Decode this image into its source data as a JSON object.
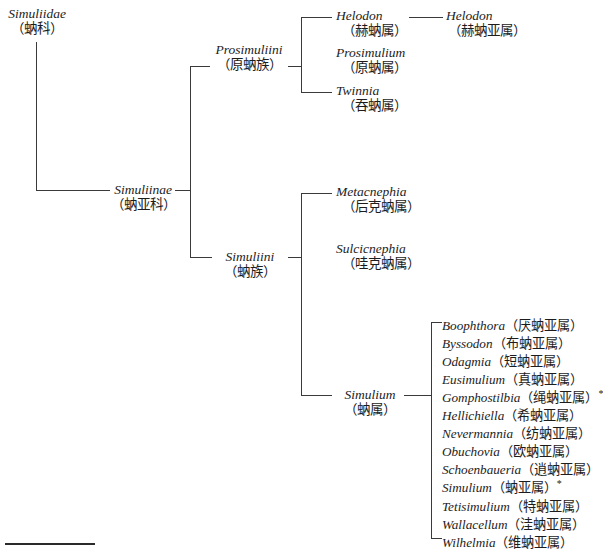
{
  "figure": {
    "type": "cladogram",
    "footnote_rule": true
  },
  "taxa": {
    "family": {
      "latin": "Simuliidae",
      "chinese": "（蚋科）"
    },
    "subfamily": {
      "latin": "Simuliinae",
      "chinese": "（蚋亚科）"
    },
    "tribe_prosimuliini": {
      "latin": "Prosimuliini",
      "chinese": "（原蚋族）"
    },
    "tribe_simuliini": {
      "latin": "Simuliini",
      "chinese": "（蚋族）"
    },
    "genus_helodon": {
      "latin": "Helodon",
      "chinese": "（赫蚋属）"
    },
    "subgenus_helodon": {
      "latin": "Helodon",
      "chinese": "（赫蚋亚属）"
    },
    "genus_prosimulium": {
      "latin": "Prosimulium",
      "chinese": "（原蚋属）"
    },
    "genus_twinnia": {
      "latin": "Twinnia",
      "chinese": "（吞蚋属）"
    },
    "genus_metacnephia": {
      "latin": "Metacnephia",
      "chinese": "（后克蚋属）"
    },
    "genus_sulcicnephia": {
      "latin": "Sulcicnephia",
      "chinese": "（哇克蚋属）"
    },
    "genus_simulium": {
      "latin": "Simulium",
      "chinese": "（蚋属）"
    }
  },
  "subgenera": [
    {
      "latin": "Boophthora",
      "chinese": "（厌蚋亚属）",
      "mark": ""
    },
    {
      "latin": "Byssodon",
      "chinese": "（布蚋亚属）",
      "mark": ""
    },
    {
      "latin": "Odagmia",
      "chinese": "（短蚋亚属）",
      "mark": ""
    },
    {
      "latin": "Eusimulium",
      "chinese": "（真蚋亚属）",
      "mark": ""
    },
    {
      "latin": "Gomphostilbia",
      "chinese": "（绳蚋亚属）",
      "mark": "*"
    },
    {
      "latin": "Hellichiella",
      "chinese": "（希蚋亚属）",
      "mark": ""
    },
    {
      "latin": "Nevermannia",
      "chinese": "（纺蚋亚属）",
      "mark": ""
    },
    {
      "latin": "Obuchovia",
      "chinese": "（欧蚋亚属）",
      "mark": ""
    },
    {
      "latin": "Schoenbaueria",
      "chinese": "（逍蚋亚属）",
      "mark": ""
    },
    {
      "latin": "Simulium",
      "chinese": "（蚋亚属）",
      "mark": "*"
    },
    {
      "latin": "Tetisimulium",
      "chinese": "（特蚋亚属）",
      "mark": ""
    },
    {
      "latin": "Wallacellum",
      "chinese": "（洼蚋亚属）",
      "mark": ""
    },
    {
      "latin": "Wilhelmia",
      "chinese": "（维蚋亚属）",
      "mark": ""
    }
  ],
  "colors": {
    "text": "#1c1c1c",
    "line": "#3a3a3a",
    "background": "#ffffff"
  }
}
